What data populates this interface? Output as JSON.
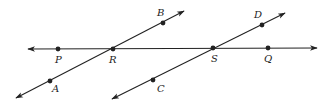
{
  "diagram": {
    "colors": {
      "stroke": "#222222",
      "background": "#ffffff"
    },
    "lines": [
      {
        "name": "line-PQ",
        "from": [
          28,
          49
        ],
        "to": [
          317,
          48
        ],
        "arrows": "both",
        "through": [
          "P",
          "R",
          "S",
          "Q"
        ]
      },
      {
        "name": "line-AB",
        "from": [
          16,
          98
        ],
        "to": [
          184,
          11
        ],
        "arrows": "both",
        "through": [
          "A",
          "R",
          "B"
        ]
      },
      {
        "name": "line-CD",
        "from": [
          112,
          99
        ],
        "to": [
          285,
          13
        ],
        "arrows": "both",
        "through": [
          "C",
          "S",
          "D"
        ]
      }
    ],
    "points": [
      {
        "label": "P",
        "x": 58,
        "y": 49,
        "lx": 55,
        "ly": 63
      },
      {
        "label": "R",
        "x": 113,
        "y": 49,
        "lx": 109,
        "ly": 63
      },
      {
        "label": "S",
        "x": 213,
        "y": 48,
        "lx": 211,
        "ly": 62
      },
      {
        "label": "Q",
        "x": 268,
        "y": 48,
        "lx": 264,
        "ly": 62
      },
      {
        "label": "A",
        "x": 50,
        "y": 81,
        "lx": 52,
        "ly": 92
      },
      {
        "label": "B",
        "x": 163,
        "y": 23,
        "lx": 157,
        "ly": 16
      },
      {
        "label": "C",
        "x": 153,
        "y": 80,
        "lx": 157,
        "ly": 92
      },
      {
        "label": "D",
        "x": 262,
        "y": 25,
        "lx": 254,
        "ly": 18
      }
    ]
  }
}
